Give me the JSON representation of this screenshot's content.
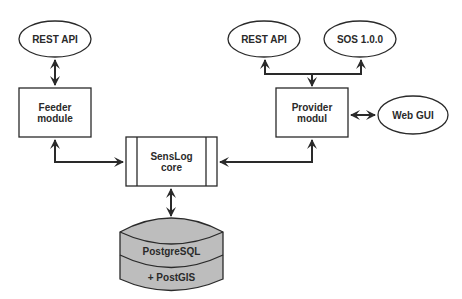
{
  "diagram": {
    "nodes": {
      "feeder_rest_api": {
        "label": "REST API",
        "shape": "ellipse"
      },
      "feeder_module": {
        "label": "Feeder\nmodule",
        "shape": "rectangle"
      },
      "senslog_core": {
        "label": "SensLog\ncore",
        "shape": "process"
      },
      "provider_modul": {
        "label": "Provider\nmodul",
        "shape": "rectangle"
      },
      "provider_rest_api": {
        "label": "REST API",
        "shape": "ellipse"
      },
      "sos": {
        "label": "SOS 1.0.0",
        "shape": "ellipse"
      },
      "web_gui": {
        "label": "Web GUI",
        "shape": "ellipse"
      },
      "database_top": {
        "label": "PostgreSQL",
        "shape": "database"
      },
      "database_bottom": {
        "label": "+ PostGIS",
        "shape": "database"
      }
    },
    "edges": [
      {
        "from": "feeder_rest_api",
        "to": "feeder_module",
        "direction": "both"
      },
      {
        "from": "feeder_module",
        "to": "senslog_core",
        "direction": "both"
      },
      {
        "from": "provider_modul",
        "to": "senslog_core",
        "direction": "both"
      },
      {
        "from": "provider_modul",
        "to": "provider_rest_api",
        "direction": "forward"
      },
      {
        "from": "provider_modul",
        "to": "sos",
        "direction": "forward"
      },
      {
        "from": "provider_modul",
        "to": "web_gui",
        "direction": "both"
      },
      {
        "from": "senslog_core",
        "to": "database_top",
        "direction": "both"
      }
    ],
    "colors": {
      "stroke": "#2a2a2a",
      "database_fill": "#bdbdbd",
      "background": "#ffffff"
    }
  }
}
